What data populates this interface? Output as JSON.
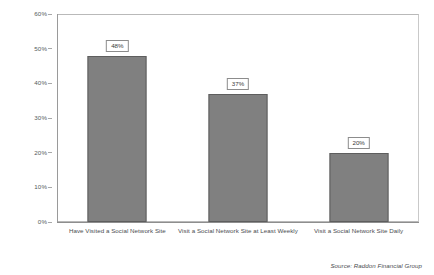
{
  "chart_data": {
    "type": "bar",
    "title": "",
    "subtitle": "",
    "xlabel": "",
    "ylabel": "",
    "ylim": [
      0,
      60
    ],
    "grid": false,
    "legend": false,
    "orientation": "vertical",
    "bar_color": "#808080",
    "bar_border_color": "#5e5e5e",
    "categories": [
      "Have Visited a Social Network Site",
      "Visit a Social Network Site at Least Weekly",
      "Visit a Social Network Site Daily"
    ],
    "values": [
      48,
      37,
      20
    ],
    "data_labels": [
      "48%",
      "37%",
      "20%"
    ],
    "ytick_labels": [
      "0%",
      "10%",
      "20%",
      "30%",
      "40%",
      "50%",
      "60%"
    ],
    "ytick_values": [
      0,
      10,
      20,
      30,
      40,
      50,
      60
    ]
  },
  "source": {
    "text": "Source: Raddon Financial Group"
  }
}
